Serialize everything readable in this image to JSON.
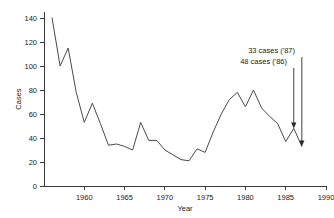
{
  "chart_data": {
    "type": "line",
    "title": "",
    "xlabel": "Year",
    "ylabel": "Cases",
    "xlim": [
      1955,
      1990
    ],
    "ylim": [
      0,
      145
    ],
    "xticks": [
      1960,
      1965,
      1970,
      1975,
      1980,
      1985,
      1990
    ],
    "xtick_labels": [
      "1960",
      "1965",
      "1970",
      "1975",
      "1980",
      "1985",
      "1990"
    ],
    "yticks": [
      0,
      20,
      40,
      60,
      80,
      100,
      120,
      140
    ],
    "ytick_labels": [
      "0",
      "20",
      "40",
      "60",
      "80",
      "100",
      "120",
      "140"
    ],
    "grid": false,
    "legend": "none",
    "x": [
      1956,
      1957,
      1958,
      1959,
      1960,
      1961,
      1962,
      1963,
      1964,
      1965,
      1966,
      1967,
      1968,
      1969,
      1970,
      1971,
      1972,
      1973,
      1974,
      1975,
      1976,
      1977,
      1978,
      1979,
      1980,
      1981,
      1982,
      1983,
      1984,
      1985,
      1986,
      1987
    ],
    "values": [
      140,
      100,
      115,
      78,
      53,
      69,
      52,
      34,
      35,
      33,
      30,
      53,
      38,
      38,
      30,
      26,
      22,
      21,
      31,
      28,
      45,
      60,
      72,
      78,
      66,
      80,
      65,
      58,
      52,
      37,
      48,
      33
    ],
    "series": [
      {
        "name": "Cases",
        "values": [
          140,
          100,
          115,
          78,
          53,
          69,
          52,
          34,
          35,
          33,
          30,
          53,
          38,
          38,
          30,
          26,
          22,
          21,
          31,
          28,
          45,
          60,
          72,
          78,
          66,
          80,
          65,
          58,
          52,
          37,
          48,
          33
        ]
      }
    ],
    "annotations": [
      {
        "text": "33 cases ('87)",
        "x": 1987,
        "y": 33
      },
      {
        "text": "48 cases ('86)",
        "x": 1986,
        "y": 48
      }
    ]
  },
  "axes": {
    "y_title": "Cases",
    "x_title": "Year"
  },
  "annotations": {
    "top_label": "33 cases ('87)",
    "bottom_label": "48 cases ('86)"
  },
  "colors": {
    "line": "#4a4a4a",
    "axis": "#3a3a3a",
    "text": "#1a1a1a",
    "background": "#ffffff"
  }
}
